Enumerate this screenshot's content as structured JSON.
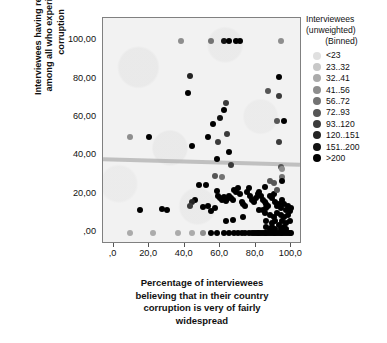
{
  "chart_data": {
    "type": "scatter",
    "title": "",
    "xlabel_lines": [
      "Percentage of interviewees",
      "believing that in their country",
      "corruption is very of fairly",
      "widespread"
    ],
    "ylabel_lines": [
      "Interviewees having reported",
      "among all who experienced",
      "corruption"
    ],
    "xlim": [
      -6,
      106
    ],
    "ylim": [
      -6,
      112
    ],
    "xticks": [
      ",0",
      "20,0",
      "40,0",
      "60,0",
      "80,0",
      "100,0"
    ],
    "xtick_values": [
      0,
      20,
      40,
      60,
      80,
      100
    ],
    "yticks": [
      ",00",
      "20,00",
      "40,00",
      "60,00",
      "80,00",
      "100,00"
    ],
    "ytick_values": [
      0,
      20,
      40,
      60,
      80,
      100
    ],
    "grid": false,
    "legend_position": "right",
    "legend": {
      "title_lines": [
        "Interviewees",
        "(unweighted)",
        "(Binned)"
      ],
      "entries": [
        {
          "label": "<23",
          "color": "#e0e0e0"
        },
        {
          "label": "23..32",
          "color": "#c8c8c8"
        },
        {
          "label": "32..41",
          "color": "#ababab"
        },
        {
          "label": "41..56",
          "color": "#8e8e8e"
        },
        {
          "label": "56..72",
          "color": "#737373"
        },
        {
          "label": "72..93",
          "color": "#565656"
        },
        {
          "label": "93..120",
          "color": "#3b3b3b"
        },
        {
          "label": "120..151",
          "color": "#242424"
        },
        {
          "label": "151..200",
          "color": "#121212"
        },
        {
          "label": ">200",
          "color": "#000000"
        }
      ]
    },
    "fit_line": {
      "y_left": 38.5,
      "y_right": 35.5,
      "color": "#afafaf"
    },
    "points": [
      [
        38,
        100,
        3
      ],
      [
        55,
        100,
        4
      ],
      [
        62,
        100,
        8
      ],
      [
        65,
        100,
        9
      ],
      [
        69,
        100,
        9
      ],
      [
        71,
        100,
        9
      ],
      [
        94,
        100,
        3
      ],
      [
        9,
        50,
        3
      ],
      [
        20,
        50,
        9
      ],
      [
        43,
        81.5,
        7
      ],
      [
        42,
        73,
        9
      ],
      [
        44,
        45,
        9
      ],
      [
        53,
        50,
        9
      ],
      [
        56,
        56.5,
        9
      ],
      [
        58,
        38.5,
        9
      ],
      [
        59,
        47,
        6
      ],
      [
        60,
        60,
        8
      ],
      [
        62,
        64,
        9
      ],
      [
        63,
        67.5,
        6
      ],
      [
        64,
        51.5,
        6
      ],
      [
        65,
        42,
        9
      ],
      [
        66,
        35,
        6
      ],
      [
        61,
        29,
        4
      ],
      [
        57,
        29.5,
        5
      ],
      [
        93,
        81,
        9
      ],
      [
        87,
        74,
        5
      ],
      [
        93,
        71.5,
        6
      ],
      [
        96,
        58,
        9
      ],
      [
        92,
        58,
        5
      ],
      [
        93,
        47,
        6
      ],
      [
        94,
        34,
        5
      ],
      [
        95,
        33,
        3
      ],
      [
        95,
        29,
        4
      ],
      [
        88,
        27,
        5
      ],
      [
        95,
        27,
        9
      ],
      [
        52,
        25,
        9
      ],
      [
        48,
        25,
        9
      ],
      [
        46,
        17,
        9
      ],
      [
        44,
        16,
        7
      ],
      [
        43,
        14,
        6
      ],
      [
        50,
        13.5,
        9
      ],
      [
        53,
        14,
        9
      ],
      [
        55,
        11,
        9
      ],
      [
        57,
        13,
        9
      ],
      [
        58,
        21.5,
        9
      ],
      [
        59,
        19,
        9
      ],
      [
        60,
        18,
        9
      ],
      [
        61,
        17,
        9
      ],
      [
        62,
        18.5,
        9
      ],
      [
        63,
        16.5,
        9
      ],
      [
        64,
        17.5,
        9
      ],
      [
        65,
        19,
        9
      ],
      [
        66,
        18,
        9
      ],
      [
        67,
        17,
        9
      ],
      [
        68,
        22,
        9
      ],
      [
        69,
        21,
        9
      ],
      [
        70,
        23,
        9
      ],
      [
        71,
        20,
        9
      ],
      [
        72,
        16,
        9
      ],
      [
        73,
        15,
        9
      ],
      [
        74,
        14,
        9
      ],
      [
        75,
        21,
        9
      ],
      [
        76,
        23,
        9
      ],
      [
        77,
        19,
        9
      ],
      [
        78,
        17,
        9
      ],
      [
        79,
        16,
        9
      ],
      [
        80,
        18,
        9
      ],
      [
        81,
        20,
        9
      ],
      [
        82,
        21,
        9
      ],
      [
        83,
        19,
        9
      ],
      [
        84,
        17,
        9
      ],
      [
        85,
        16,
        9
      ],
      [
        86,
        15,
        9
      ],
      [
        87,
        14,
        9
      ],
      [
        88,
        19,
        9
      ],
      [
        89,
        18,
        9
      ],
      [
        90,
        20,
        9
      ],
      [
        91,
        16,
        9
      ],
      [
        92,
        14,
        9
      ],
      [
        93,
        15,
        9
      ],
      [
        94,
        13,
        9
      ],
      [
        95,
        17,
        9
      ],
      [
        96,
        15,
        9
      ],
      [
        97,
        12,
        9
      ],
      [
        98,
        14,
        9
      ],
      [
        99,
        11,
        9
      ],
      [
        100,
        13,
        9
      ],
      [
        15,
        12,
        9
      ],
      [
        27,
        12.5,
        9
      ],
      [
        30,
        11.5,
        9
      ],
      [
        63,
        6,
        9
      ],
      [
        67,
        6.5,
        9
      ],
      [
        73,
        8,
        9
      ],
      [
        85,
        10,
        9
      ],
      [
        88,
        9,
        9
      ],
      [
        90,
        8,
        9
      ],
      [
        92,
        10,
        9
      ],
      [
        94,
        9,
        9
      ],
      [
        96,
        8,
        9
      ],
      [
        98,
        9,
        9
      ],
      [
        86,
        6,
        9
      ],
      [
        89,
        5,
        9
      ],
      [
        91,
        6,
        9
      ],
      [
        93,
        4,
        9
      ],
      [
        95,
        6,
        9
      ],
      [
        97,
        5,
        9
      ],
      [
        99,
        6,
        9
      ],
      [
        84,
        12,
        9
      ],
      [
        86,
        13,
        9
      ],
      [
        82,
        12,
        9
      ],
      [
        9,
        0,
        2
      ],
      [
        22,
        0,
        2
      ],
      [
        36,
        0,
        2
      ],
      [
        44,
        0,
        2
      ],
      [
        50,
        0,
        3
      ],
      [
        55,
        0,
        9
      ],
      [
        58,
        0,
        9
      ],
      [
        62,
        0,
        9
      ],
      [
        65,
        0,
        9
      ],
      [
        68,
        0,
        9
      ],
      [
        70,
        0,
        9
      ],
      [
        72,
        0,
        9
      ],
      [
        74,
        0,
        9
      ],
      [
        76,
        0,
        9
      ],
      [
        78,
        0,
        9
      ],
      [
        79,
        0,
        9
      ],
      [
        80,
        0,
        9
      ],
      [
        81,
        0,
        9
      ],
      [
        82,
        0,
        9
      ],
      [
        83,
        0,
        9
      ],
      [
        84,
        0,
        9
      ],
      [
        85,
        0,
        9
      ],
      [
        86,
        0,
        9
      ],
      [
        87,
        0,
        9
      ],
      [
        88,
        0,
        9
      ],
      [
        89,
        0,
        9
      ],
      [
        90,
        0,
        9
      ],
      [
        91,
        0,
        9
      ],
      [
        92,
        0,
        9
      ],
      [
        93,
        0,
        9
      ],
      [
        94,
        0,
        9
      ],
      [
        95,
        0,
        9
      ],
      [
        96,
        0,
        9
      ],
      [
        97,
        0,
        9
      ],
      [
        98,
        0,
        9
      ],
      [
        99,
        0,
        9
      ],
      [
        100,
        0,
        9
      ],
      [
        88,
        2,
        9
      ],
      [
        91,
        2,
        9
      ],
      [
        94,
        2,
        9
      ],
      [
        97,
        2,
        9
      ],
      [
        86,
        3,
        9
      ],
      [
        89,
        3,
        9
      ],
      [
        96,
        3,
        9
      ],
      [
        92,
        22,
        5
      ],
      [
        90,
        26,
        5
      ],
      [
        85,
        24,
        9
      ]
    ]
  }
}
